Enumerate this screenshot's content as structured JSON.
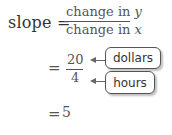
{
  "equation": {
    "lhs": "slope =",
    "numerator_text": "change in ",
    "numerator_var": "y",
    "denominator_text": "change in ",
    "denominator_var": "x",
    "step1_eq": "=",
    "step1_numerator": "20",
    "step1_denominator": "4",
    "step2_eq": "=",
    "step2_value": "5"
  },
  "labels": {
    "numerator_label": "dollars",
    "denominator_label": "hours"
  }
}
